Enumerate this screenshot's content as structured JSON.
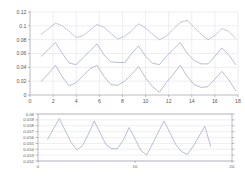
{
  "figure": {
    "background": "#ffffff",
    "panel_count": 2
  },
  "chart_data": [
    {
      "type": "line",
      "id": "upper-panel",
      "title": "",
      "xlabel": "",
      "ylabel": "",
      "xlim": [
        0,
        18
      ],
      "ylim": [
        0,
        0.12
      ],
      "xticks": [
        0,
        2,
        4,
        6,
        8,
        10,
        12,
        14,
        16,
        18
      ],
      "xtick_labels": [
        "0",
        "2",
        "4",
        "6",
        "8",
        "10",
        "12",
        "14",
        "16",
        "18"
      ],
      "yticks": [
        0,
        0.02,
        0.04,
        0.06,
        0.08,
        0.1,
        0.12
      ],
      "ytick_labels": [
        "0",
        "0.02",
        "0.04",
        "0.06",
        "0.08",
        "0.1",
        "0.12"
      ],
      "grid": true,
      "legend": "none",
      "x": [
        1,
        1.6,
        2.2,
        2.8,
        3.4,
        4,
        4.6,
        5.2,
        5.8,
        6.4,
        7,
        7.6,
        8.2,
        8.8,
        9.4,
        10,
        10.6,
        11.2,
        11.8,
        12.4,
        13,
        13.6,
        14.2,
        14.8,
        15.4,
        16,
        16.6,
        17.2,
        17.8
      ],
      "series": [
        {
          "name": "series-upper-dashed",
          "style": "dashed",
          "color": "#9aa3c0",
          "values": [
            0.088,
            0.096,
            0.104,
            0.1,
            0.092,
            0.083,
            0.086,
            0.094,
            0.102,
            0.098,
            0.089,
            0.081,
            0.085,
            0.093,
            0.103,
            0.097,
            0.088,
            0.08,
            0.085,
            0.095,
            0.105,
            0.108,
            0.098,
            0.088,
            0.08,
            0.086,
            0.096,
            0.092,
            0.082
          ]
        },
        {
          "name": "series-middle-solid",
          "style": "solid",
          "color": "#9aa3c0",
          "values": [
            0.056,
            0.066,
            0.076,
            0.06,
            0.046,
            0.044,
            0.054,
            0.064,
            0.074,
            0.058,
            0.048,
            0.047,
            0.047,
            0.06,
            0.071,
            0.056,
            0.046,
            0.044,
            0.056,
            0.066,
            0.076,
            0.06,
            0.05,
            0.045,
            0.045,
            0.056,
            0.068,
            0.058,
            0.044
          ]
        },
        {
          "name": "series-lower-solid",
          "style": "solid",
          "color": "#9aa3c0",
          "values": [
            0.02,
            0.031,
            0.043,
            0.026,
            0.013,
            0.018,
            0.028,
            0.038,
            0.043,
            0.027,
            0.015,
            0.014,
            0.02,
            0.03,
            0.041,
            0.025,
            0.012,
            0.004,
            0.018,
            0.03,
            0.043,
            0.027,
            0.015,
            0.011,
            0.012,
            0.023,
            0.034,
            0.022,
            0.006
          ]
        }
      ]
    },
    {
      "type": "line",
      "id": "lower-panel",
      "title": "",
      "xlabel": "",
      "ylabel": "",
      "xlim": [
        0,
        20
      ],
      "ylim": [
        0.052,
        0.06
      ],
      "xticks": [
        0,
        10,
        20
      ],
      "xtick_labels": [
        "0",
        "10",
        "20"
      ],
      "yticks": [
        0.052,
        0.053,
        0.054,
        0.055,
        0.056,
        0.057,
        0.058,
        0.059,
        0.06
      ],
      "ytick_labels": [
        "0.052",
        "0.053",
        "0.054",
        "0.055",
        "0.056",
        "0.057",
        "0.058",
        "0.059",
        "0.06"
      ],
      "grid": true,
      "legend": "none",
      "x": [
        1,
        1.6,
        2.2,
        2.8,
        3.4,
        4,
        4.6,
        5.2,
        5.8,
        6.4,
        7,
        7.6,
        8.2,
        8.8,
        9.4,
        10,
        10.6,
        11.2,
        11.8,
        12.4,
        13,
        13.6,
        14.2,
        14.8,
        15.4,
        16,
        16.6,
        17.2,
        17.8
      ],
      "series": [
        {
          "name": "series-sawtooth",
          "style": "solid",
          "color": "#9aa3c0",
          "values": [
            0.0557,
            0.0575,
            0.0592,
            0.0572,
            0.0552,
            0.0539,
            0.0546,
            0.0566,
            0.0588,
            0.0568,
            0.0548,
            0.0541,
            0.0541,
            0.0556,
            0.0577,
            0.0558,
            0.0538,
            0.053,
            0.0549,
            0.0569,
            0.0588,
            0.0568,
            0.0548,
            0.0536,
            0.0531,
            0.0545,
            0.0562,
            0.0579,
            0.0545
          ]
        }
      ]
    }
  ]
}
